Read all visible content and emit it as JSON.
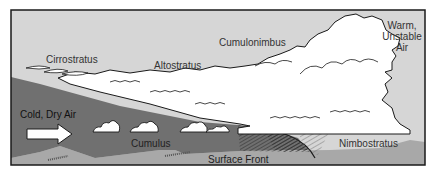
{
  "diagram": {
    "labels": {
      "cirrostratus": "Cirrostratus",
      "altostratus": "Altostratus",
      "cumulonimbus": "Cumulonimbus",
      "warm_air_line1": "Warm,",
      "warm_air_line2": "Unstable",
      "warm_air_line3": "Air",
      "cold_air": "Cold, Dry Air",
      "cumulus": "Cumulus",
      "surface_front": "Surface Front",
      "nimbostratus": "Nimbostratus"
    },
    "colors": {
      "sky": "#d6d6d6",
      "cold_air_mass": "#707070",
      "ground": "#a8a8a8",
      "cloud": "#ffffff",
      "outline": "#1a1a1a"
    }
  }
}
